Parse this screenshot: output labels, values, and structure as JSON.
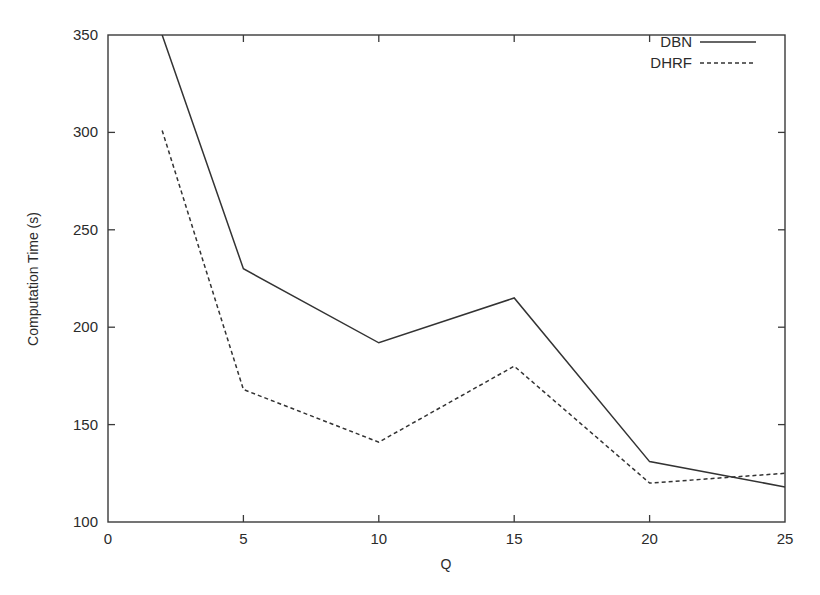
{
  "chart_data": {
    "type": "line",
    "title": "",
    "xlabel": "Q",
    "ylabel": "Computation Time (s)",
    "xlim": [
      0,
      25
    ],
    "ylim": [
      100,
      350
    ],
    "xticks": [
      0,
      5,
      10,
      15,
      20,
      25
    ],
    "yticks": [
      100,
      150,
      200,
      250,
      300,
      350
    ],
    "xtick_labels": [
      "0",
      "5",
      "10",
      "15",
      "20",
      "25"
    ],
    "ytick_labels": [
      "100",
      "150",
      "200",
      "250",
      "300",
      "350"
    ],
    "grid": false,
    "legend_position": "top-right",
    "frame": "box",
    "x": [
      2,
      5,
      10,
      15,
      20,
      25
    ],
    "series": [
      {
        "name": "DBN",
        "style": "solid",
        "color": "#333333",
        "values": [
          350,
          230,
          192,
          215,
          131,
          118
        ]
      },
      {
        "name": "DHRF",
        "style": "dashed",
        "color": "#333333",
        "values": [
          301,
          168,
          141,
          180,
          120,
          125
        ]
      }
    ],
    "annotations": []
  },
  "legend": {
    "entries": [
      {
        "label": "DBN"
      },
      {
        "label": "DHRF"
      }
    ]
  },
  "axes": {
    "x_title": "Q",
    "y_title": "Computation Time (s)"
  }
}
